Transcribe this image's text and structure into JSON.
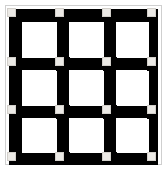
{
  "figure": {
    "width": 167,
    "height": 170
  },
  "colors": {
    "background": "#ffffff",
    "bar": "#000000",
    "cell": "#ffffff",
    "node": "#eceae6",
    "node_border": "#d2cfca",
    "frame_border": "#cfcfcf"
  },
  "chart_data": {
    "type": "heatmap",
    "rows": 3,
    "columns": 3,
    "bar_thickness": 13,
    "node_size": 9,
    "grid_lines_x": [
      9,
      57,
      104,
      149
    ],
    "grid_lines_y": [
      9,
      58,
      106,
      153
    ],
    "cells": [
      {
        "row": 0,
        "col": 0,
        "fill": "white"
      },
      {
        "row": 0,
        "col": 1,
        "fill": "white"
      },
      {
        "row": 0,
        "col": 2,
        "fill": "white"
      },
      {
        "row": 1,
        "col": 0,
        "fill": "white"
      },
      {
        "row": 1,
        "col": 1,
        "fill": "white"
      },
      {
        "row": 1,
        "col": 2,
        "fill": "white"
      },
      {
        "row": 2,
        "col": 0,
        "fill": "white"
      },
      {
        "row": 2,
        "col": 1,
        "fill": "white"
      },
      {
        "row": 2,
        "col": 2,
        "fill": "white"
      }
    ],
    "nodes": [
      {
        "x": 13,
        "y": 13
      },
      {
        "x": 61,
        "y": 13
      },
      {
        "x": 108,
        "y": 13
      },
      {
        "x": 153,
        "y": 13
      },
      {
        "x": 13,
        "y": 62
      },
      {
        "x": 61,
        "y": 62
      },
      {
        "x": 108,
        "y": 62
      },
      {
        "x": 153,
        "y": 62
      },
      {
        "x": 13,
        "y": 110
      },
      {
        "x": 61,
        "y": 110
      },
      {
        "x": 108,
        "y": 110
      },
      {
        "x": 153,
        "y": 110
      },
      {
        "x": 13,
        "y": 157
      },
      {
        "x": 61,
        "y": 157
      },
      {
        "x": 108,
        "y": 157
      },
      {
        "x": 153,
        "y": 157
      }
    ],
    "horizontal_bars": [
      {
        "x": 9,
        "y": 9,
        "width": 149,
        "height": 13
      },
      {
        "x": 9,
        "y": 57,
        "width": 149,
        "height": 13
      },
      {
        "x": 9,
        "y": 105,
        "width": 149,
        "height": 13
      },
      {
        "x": 9,
        "y": 152,
        "width": 149,
        "height": 13
      }
    ],
    "vertical_bars": [
      {
        "x": 9,
        "y": 9,
        "width": 13,
        "height": 156
      },
      {
        "x": 56,
        "y": 9,
        "width": 13,
        "height": 156
      },
      {
        "x": 103,
        "y": 9,
        "width": 13,
        "height": 156
      },
      {
        "x": 147,
        "y": 9,
        "width": 11,
        "height": 156
      }
    ],
    "xlabel": "",
    "ylabel": "",
    "legend": []
  }
}
